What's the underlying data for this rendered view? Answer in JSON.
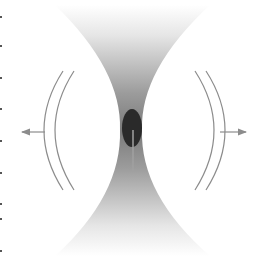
{
  "diagram": {
    "colors": {
      "background": "#ffffff",
      "band_dark": "#6e6e6e",
      "band_light": "#ffffff",
      "ellipse": "#2a2a2a",
      "streak": "#9a9a9a",
      "arc": "#8c8c8c",
      "arrow": "#8c8c8c",
      "tick": "#555555"
    },
    "left_ticks_y": [
      16,
      45,
      77,
      108,
      140,
      172,
      203,
      218,
      250
    ],
    "arrows": [
      {
        "side": "left",
        "direction": "left"
      },
      {
        "side": "right",
        "direction": "right"
      }
    ]
  }
}
